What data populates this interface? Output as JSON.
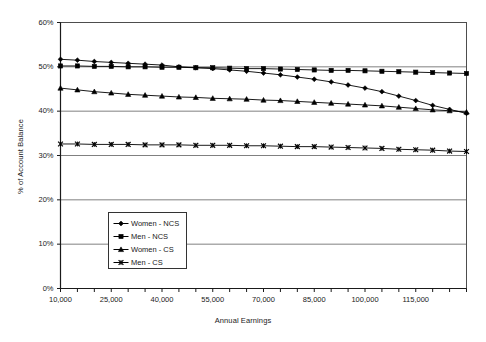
{
  "chart_data": {
    "type": "line",
    "title": "",
    "xlabel": "Annual Earnings",
    "ylabel": "% of Account Balance",
    "xlim": [
      10000,
      130000
    ],
    "ylim": [
      0,
      60
    ],
    "grid": true,
    "legend_position": "inside-lower-left",
    "y_ticks": [
      "0%",
      "10%",
      "20%",
      "30%",
      "40%",
      "50%",
      "60%"
    ],
    "y_tick_values": [
      0,
      10,
      20,
      30,
      40,
      50,
      60
    ],
    "x_tick_labels": [
      "10,000",
      "25,000",
      "40,000",
      "55,000",
      "70,000",
      "85,000",
      "100,000",
      "115,000"
    ],
    "x_tick_values": [
      10000,
      25000,
      40000,
      55000,
      70000,
      85000,
      100000,
      115000
    ],
    "x": [
      10000,
      15000,
      20000,
      25000,
      30000,
      35000,
      40000,
      45000,
      50000,
      55000,
      60000,
      65000,
      70000,
      75000,
      80000,
      85000,
      90000,
      95000,
      100000,
      105000,
      110000,
      115000,
      120000,
      125000,
      130000
    ],
    "series": [
      {
        "name": "Women - NCS",
        "marker": "diamond",
        "color": "#000000",
        "values": [
          51.7,
          51.5,
          51.2,
          51.0,
          50.8,
          50.6,
          50.4,
          50.0,
          49.8,
          49.6,
          49.3,
          49.0,
          48.6,
          48.2,
          47.7,
          47.2,
          46.6,
          45.9,
          45.2,
          44.4,
          43.4,
          42.4,
          41.3,
          40.4,
          39.5
        ]
      },
      {
        "name": "Men - NCS",
        "marker": "square",
        "color": "#000000",
        "values": [
          50.2,
          50.2,
          50.1,
          50.1,
          50.0,
          50.0,
          49.9,
          49.9,
          49.8,
          49.8,
          49.7,
          49.6,
          49.6,
          49.5,
          49.4,
          49.3,
          49.2,
          49.2,
          49.1,
          49.0,
          48.9,
          48.8,
          48.7,
          48.6,
          48.5
        ]
      },
      {
        "name": "Women - CS",
        "marker": "triangle",
        "color": "#000000",
        "values": [
          45.2,
          44.8,
          44.4,
          44.1,
          43.8,
          43.6,
          43.4,
          43.2,
          43.1,
          42.9,
          42.8,
          42.7,
          42.5,
          42.4,
          42.2,
          42.0,
          41.8,
          41.6,
          41.4,
          41.2,
          40.9,
          40.6,
          40.3,
          40.1,
          39.8
        ]
      },
      {
        "name": "Men - CS",
        "marker": "cross",
        "color": "#000000",
        "values": [
          32.6,
          32.6,
          32.5,
          32.5,
          32.5,
          32.4,
          32.4,
          32.4,
          32.3,
          32.3,
          32.3,
          32.2,
          32.2,
          32.1,
          32.0,
          32.0,
          31.9,
          31.8,
          31.7,
          31.6,
          31.4,
          31.3,
          31.2,
          31.0,
          30.9
        ]
      }
    ]
  },
  "legend": {
    "items": [
      {
        "label": "Women - NCS",
        "marker": "diamond"
      },
      {
        "label": "Men - NCS",
        "marker": "square"
      },
      {
        "label": "Women - CS",
        "marker": "triangle"
      },
      {
        "label": "Men - CS",
        "marker": "cross"
      }
    ]
  },
  "axes": {
    "y_title": "% of Account Balance",
    "x_title": "Annual Earnings"
  }
}
